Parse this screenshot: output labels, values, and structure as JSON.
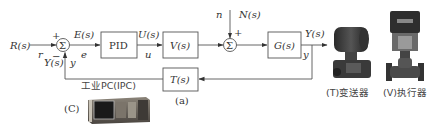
{
  "diagram": {
    "type": "feedback-control-block-diagram",
    "inputs": {
      "R": "R(s)",
      "r": "r"
    },
    "sum1": {
      "symbol": "Σ",
      "plus": "+",
      "minus": "−"
    },
    "error": {
      "E": "E(s)",
      "e": "e"
    },
    "blocks": {
      "pid": "PID",
      "actuator": "V(s)",
      "plant": "G(s)",
      "transmitter": "T(s)"
    },
    "control": {
      "U": "U(s)",
      "u": "u"
    },
    "disturbance": {
      "n": "n",
      "N": "N(s)",
      "plus": "+"
    },
    "sum2": {
      "symbol": "Σ"
    },
    "output": {
      "Y": "Y(s)",
      "y": "y"
    },
    "feedback": {
      "Y": "Y(s)",
      "y": "y"
    },
    "caption": "(a)"
  },
  "devices": {
    "pc": {
      "label": "工业PC(IPC)",
      "tag": "(C)"
    },
    "transmitter": {
      "label": "(T)变送器"
    },
    "valve": {
      "label": "(V)执行器"
    }
  },
  "colors": {
    "line": "#555555",
    "text": "#333333",
    "background": "#ffffff"
  }
}
